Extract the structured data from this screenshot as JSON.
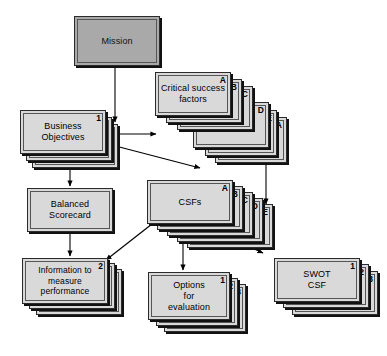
{
  "diagram": {
    "colors": {
      "card_fill": "#d9d9d9",
      "mission_fill": "#a9a9a9",
      "border": "#2b2b2b",
      "inner_border": "#555555",
      "shadow": "#111111",
      "arrow": "#000000",
      "white_connector": "#ffffff",
      "background": "#ffffff"
    },
    "nodes": [
      {
        "id": "mission",
        "label": "Mission",
        "kind": "single",
        "shaded": true,
        "tags": []
      },
      {
        "id": "business-objectives",
        "label": "Business\nObjectives",
        "line1": "Business",
        "line2": "Objectives",
        "kind": "stack",
        "shaded": false,
        "tags": [
          "1",
          "2",
          "3"
        ]
      },
      {
        "id": "critical-success-factors",
        "label": "Critical success\nfactors",
        "line1": "Critical success",
        "line2": "factors",
        "kind": "stack",
        "shaded": false,
        "tags": [
          "A",
          "B",
          "C",
          "D",
          "E",
          "A"
        ]
      },
      {
        "id": "balanced-scorecard",
        "label": "Balanced\nScorecard",
        "line1": "Balanced",
        "line2": "Scorecard",
        "kind": "single",
        "shaded": false,
        "tags": []
      },
      {
        "id": "csfs",
        "label": "CSFs",
        "kind": "stack",
        "shaded": false,
        "tags": [
          "A",
          "B",
          "C",
          "D",
          "E"
        ]
      },
      {
        "id": "information-to-measure-performance",
        "label": "Information to\nmeasure\nperformance",
        "line1": "Information to",
        "line2": "measure",
        "line3": "performance",
        "kind": "stack",
        "shaded": false,
        "tags": [
          "2",
          "3"
        ]
      },
      {
        "id": "options-for-evaluation",
        "label": "Options\nfor\nevaluation",
        "line1": "Options",
        "line2": "for",
        "line3": "evaluation",
        "kind": "stack",
        "shaded": false,
        "tags": [
          "1",
          "2",
          "3"
        ]
      },
      {
        "id": "swot-csf",
        "label": "SWOT\nCSF",
        "line1": "SWOT",
        "line2": "CSF",
        "kind": "stack",
        "shaded": false,
        "tags": [
          "1",
          "2",
          "3"
        ]
      }
    ],
    "edges": [
      {
        "id": "mission-to-business-objectives",
        "from": "mission",
        "to": "business-objectives",
        "style": "solid-arrow"
      },
      {
        "id": "business-objectives-to-critical-success-factors",
        "from": "business-objectives",
        "to": "critical-success-factors",
        "style": "solid-arrow"
      },
      {
        "id": "business-objectives-to-critical-success-factors-lower",
        "from": "business-objectives",
        "to": "critical-success-factors",
        "style": "solid-arrow"
      },
      {
        "id": "business-objectives-to-balanced-scorecard",
        "from": "business-objectives",
        "to": "balanced-scorecard",
        "style": "solid-arrow"
      },
      {
        "id": "balanced-scorecard-to-information",
        "from": "balanced-scorecard",
        "to": "information-to-measure-performance",
        "style": "solid-arrow"
      },
      {
        "id": "critical-success-factors-to-csfs",
        "from": "critical-success-factors",
        "to": "csfs",
        "style": "solid-arrow"
      },
      {
        "id": "csfs-to-information",
        "from": "csfs",
        "to": "information-to-measure-performance",
        "style": "solid-arrow"
      },
      {
        "id": "csfs-to-options",
        "from": "csfs",
        "to": "options-for-evaluation",
        "style": "solid-arrow"
      },
      {
        "id": "csfs-to-swot-csf",
        "from": "csfs",
        "to": "swot-csf",
        "style": "solid-arrow"
      },
      {
        "id": "white-connector-upper",
        "from": "business-objectives",
        "to": "critical-success-factors",
        "style": "white-slash"
      },
      {
        "id": "white-connector-lower",
        "from": "business-objectives",
        "to": "critical-success-factors",
        "style": "white-slash"
      }
    ]
  }
}
